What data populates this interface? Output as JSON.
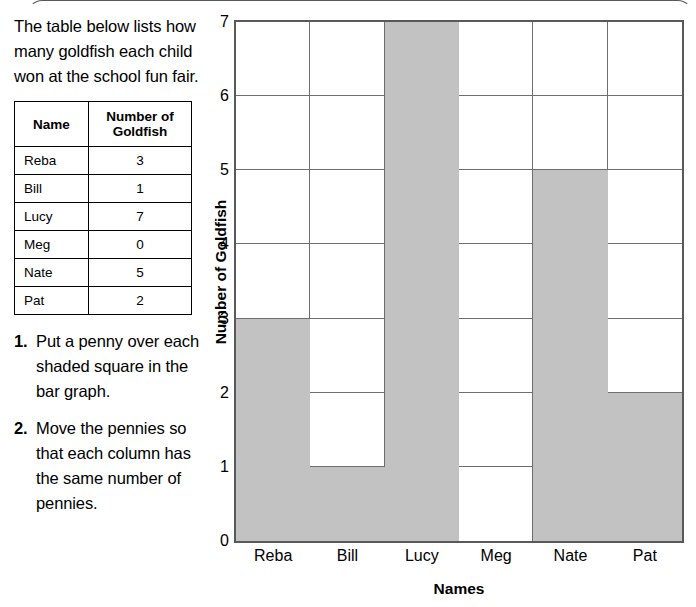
{
  "intro": "The table below lists how many goldfish each child won at the school fun fair.",
  "table": {
    "headers": [
      "Name",
      "Number of Goldfish"
    ],
    "rows": [
      {
        "name": "Reba",
        "count": "3"
      },
      {
        "name": "Bill",
        "count": "1"
      },
      {
        "name": "Lucy",
        "count": "7"
      },
      {
        "name": "Meg",
        "count": "0"
      },
      {
        "name": "Nate",
        "count": "5"
      },
      {
        "name": "Pat",
        "count": "2"
      }
    ]
  },
  "instructions": [
    {
      "num": "1.",
      "text": "Put a penny over each shaded square in the bar graph."
    },
    {
      "num": "2.",
      "text": "Move the pennies so that each column has the same number of pennies."
    }
  ],
  "chart_data": {
    "type": "bar",
    "title": "",
    "categories": [
      "Reba",
      "Bill",
      "Lucy",
      "Meg",
      "Nate",
      "Pat"
    ],
    "values": [
      3,
      1,
      7,
      0,
      5,
      2
    ],
    "xlabel": "Names",
    "ylabel": "Number of Goldfish",
    "ylim": [
      0,
      7
    ],
    "yticks": [
      "0",
      "1",
      "2",
      "3",
      "4",
      "5",
      "6",
      "7"
    ],
    "grid": true,
    "legend": false,
    "bar_color": "#c2c2c2",
    "grid_color": "#6d6e71",
    "axis_color": "#58595b"
  }
}
